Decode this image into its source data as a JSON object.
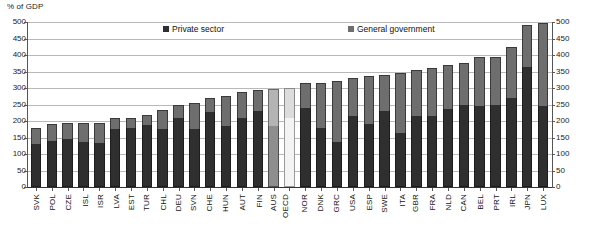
{
  "axis": {
    "unit_label": "% of GDP",
    "y_ticks": [
      0,
      50,
      100,
      150,
      200,
      250,
      300,
      350,
      400,
      450,
      500
    ],
    "y_min": 0,
    "y_max": 500
  },
  "legend": {
    "private_label": "Private sector",
    "government_label": "General government",
    "private_color": "#2f2f2f",
    "government_color": "#6e6e6e",
    "highlight_color": "#b4b4b4",
    "highlight2_color": "#dcdcdc"
  },
  "chart_data": {
    "type": "bar",
    "title": "",
    "xlabel": "",
    "ylabel": "% of GDP",
    "ylim": [
      0,
      500
    ],
    "grid": true,
    "stacked": true,
    "legend_position": "top-center",
    "categories": [
      "SVK",
      "POL",
      "CZE",
      "ISL",
      "ISR",
      "LVA",
      "EST",
      "TUR",
      "CHL",
      "DEU",
      "SVN",
      "CHE",
      "HUN",
      "AUT",
      "FIN",
      "AUS",
      "OECD",
      "NOR",
      "DNK",
      "GRC",
      "USA",
      "ESP",
      "SWE",
      "ITA",
      "GBR",
      "FRA",
      "NLD",
      "CAN",
      "BEL",
      "PRT",
      "IRL",
      "JPN",
      "LUX"
    ],
    "series": [
      {
        "name": "Private sector",
        "values": [
          130,
          138,
          145,
          135,
          133,
          175,
          178,
          187,
          175,
          210,
          175,
          228,
          185,
          210,
          230,
          185,
          208,
          240,
          180,
          135,
          215,
          190,
          230,
          165,
          215,
          215,
          235,
          250,
          245,
          250,
          270,
          365,
          245
        ]
      },
      {
        "name": "General government",
        "values": [
          48,
          52,
          50,
          60,
          62,
          33,
          32,
          30,
          57,
          40,
          80,
          43,
          90,
          78,
          65,
          112,
          92,
          75,
          135,
          185,
          115,
          145,
          110,
          180,
          140,
          145,
          135,
          125,
          150,
          143,
          155,
          125,
          252
        ]
      }
    ],
    "totals": [
      178,
      190,
      195,
      195,
      195,
      208,
      210,
      217,
      232,
      250,
      255,
      271,
      275,
      288,
      295,
      297,
      300,
      315,
      315,
      320,
      330,
      335,
      340,
      345,
      355,
      360,
      370,
      375,
      395,
      393,
      425,
      490,
      497
    ],
    "highlighted": [
      "AUS",
      "OECD"
    ]
  }
}
